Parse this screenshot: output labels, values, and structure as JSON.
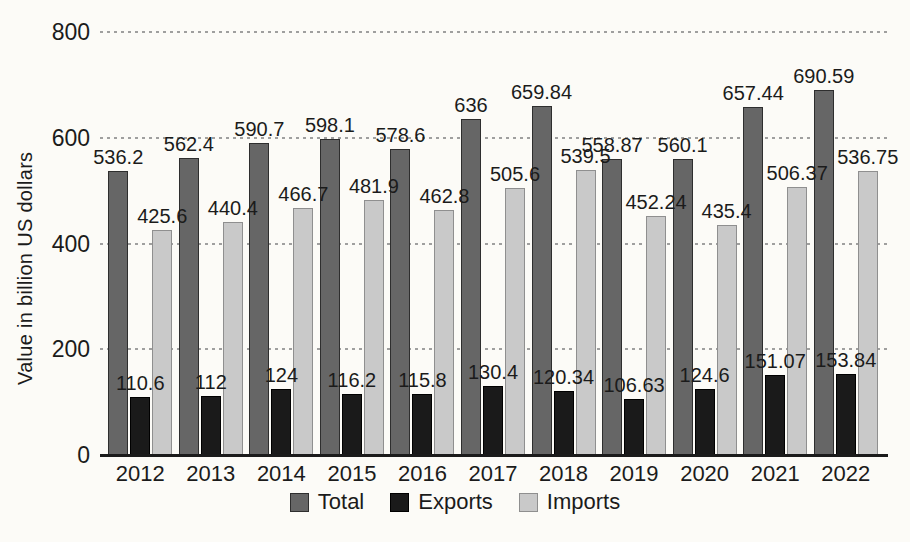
{
  "chart_data": {
    "type": "bar",
    "title": "",
    "ylabel": "Value in billion US dollars",
    "xlabel": "",
    "categories": [
      "2012",
      "2013",
      "2014",
      "2015",
      "2016",
      "2017",
      "2018",
      "2019",
      "2020",
      "2021",
      "2022"
    ],
    "series": [
      {
        "name": "Total",
        "color": "#666666",
        "border_color": "#2e2e2e",
        "values": [
          536.2,
          562.4,
          590.7,
          598.1,
          578.6,
          636,
          659.84,
          558.87,
          560.1,
          657.44,
          690.59
        ]
      },
      {
        "name": "Exports",
        "color": "#1a1a1a",
        "border_color": "#000000",
        "values": [
          110.6,
          112,
          124,
          116.2,
          115.8,
          130.4,
          120.34,
          106.63,
          124.6,
          151.07,
          153.84
        ]
      },
      {
        "name": "Imports",
        "color": "#c9c9c9",
        "border_color": "#8f8f8f",
        "values": [
          425.6,
          440.4,
          466.7,
          481.9,
          462.8,
          505.6,
          539.5,
          452.24,
          435.4,
          506.37,
          536.75
        ]
      }
    ],
    "ylim": [
      0,
      800
    ],
    "yticks": [
      0,
      200,
      400,
      600,
      800
    ],
    "grid": "horizontal-dotted",
    "legend_position": "bottom",
    "colors": {
      "background": "#fcfbf7",
      "text": "#1b1b1b",
      "gridline": "#8f8f8f",
      "axis_line": "#1b1b1b"
    }
  }
}
